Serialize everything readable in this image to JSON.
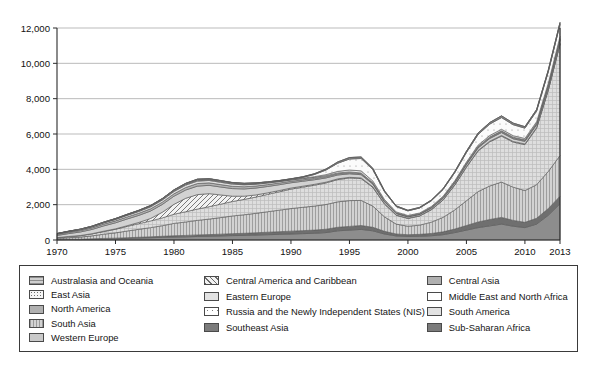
{
  "title": "",
  "legend": {
    "columns": [
      {
        "items": [
          {
            "label": "Australasia and Oceania",
            "swatch": "hlines-gray"
          },
          {
            "label": "East Asia",
            "swatch": "dots-light"
          },
          {
            "label": "North America",
            "swatch": "solid-midgray"
          },
          {
            "label": "South Asia",
            "swatch": "vlines-gray"
          },
          {
            "label": "Western Europe",
            "swatch": "solid-gray"
          }
        ]
      },
      {
        "items": [
          {
            "label": "Central America and Caribbean",
            "swatch": "diag-hatch"
          },
          {
            "label": "Eastern Europe",
            "swatch": "solid-lightgray"
          },
          {
            "label": "Russia and the Newly Independent States (NIS)",
            "swatch": "white-dot"
          },
          {
            "label": "Southeast Asia",
            "swatch": "solid-darkgray"
          }
        ]
      },
      {
        "items": [
          {
            "label": "Central Asia",
            "swatch": "solid-midgray"
          },
          {
            "label": "Middle East and North Africa",
            "swatch": "white-plain"
          },
          {
            "label": "South America",
            "swatch": "solid-lightgray"
          },
          {
            "label": "Sub-Saharan Africa",
            "swatch": "solid-darkgray"
          }
        ]
      }
    ]
  },
  "chart_data": {
    "type": "area",
    "stacked": true,
    "title": "",
    "xlabel": "",
    "ylabel": "",
    "xlim": [
      1970,
      2013
    ],
    "ylim": [
      0,
      12000
    ],
    "grid": true,
    "legend_position": "bottom",
    "ytick_labels": [
      "0",
      "2,000",
      "4,000",
      "6,000",
      "8,000",
      "10,000",
      "12,000"
    ],
    "yticks": [
      0,
      2000,
      4000,
      6000,
      8000,
      10000,
      12000
    ],
    "xtick_labels": [
      "1970",
      "1975",
      "1980",
      "1985",
      "1990",
      "1995",
      "2000",
      "2005",
      "2010",
      "2013"
    ],
    "xticks": [
      1970,
      1975,
      1980,
      1985,
      1990,
      1995,
      2000,
      2005,
      2010,
      2013
    ],
    "x": [
      1970,
      1971,
      1972,
      1973,
      1974,
      1975,
      1976,
      1977,
      1978,
      1979,
      1980,
      1981,
      1982,
      1983,
      1984,
      1985,
      1986,
      1987,
      1988,
      1989,
      1990,
      1991,
      1992,
      1993,
      1994,
      1995,
      1996,
      1997,
      1998,
      1999,
      2000,
      2001,
      2002,
      2003,
      2004,
      2005,
      2006,
      2007,
      2008,
      2009,
      2010,
      2011,
      2012,
      2013
    ],
    "series": [
      {
        "name": "Sub-Saharan Africa",
        "fill": "#8d8d8d",
        "values": [
          20,
          30,
          25,
          40,
          60,
          70,
          90,
          110,
          130,
          150,
          170,
          180,
          200,
          210,
          230,
          250,
          260,
          280,
          300,
          320,
          340,
          360,
          380,
          420,
          520,
          560,
          600,
          520,
          340,
          230,
          200,
          210,
          240,
          300,
          420,
          560,
          700,
          800,
          900,
          780,
          700,
          900,
          1400,
          2050
        ]
      },
      {
        "name": "Southeast Asia",
        "fill": "#6f6f6f",
        "values": [
          10,
          15,
          20,
          25,
          30,
          35,
          40,
          45,
          50,
          60,
          70,
          80,
          90,
          95,
          100,
          110,
          120,
          130,
          140,
          150,
          160,
          170,
          180,
          190,
          200,
          210,
          220,
          200,
          150,
          110,
          100,
          110,
          130,
          160,
          200,
          260,
          320,
          360,
          380,
          330,
          300,
          330,
          380,
          430
        ]
      },
      {
        "name": "South Asia",
        "fill": "#c8c8c8",
        "pattern": "vlines",
        "values": [
          60,
          90,
          120,
          170,
          240,
          300,
          380,
          450,
          520,
          600,
          700,
          760,
          820,
          880,
          940,
          1000,
          1050,
          1100,
          1160,
          1220,
          1280,
          1320,
          1360,
          1400,
          1440,
          1460,
          1420,
          1200,
          820,
          560,
          480,
          520,
          640,
          820,
          1080,
          1400,
          1720,
          1900,
          2000,
          1880,
          1800,
          1900,
          2100,
          2300
        ]
      },
      {
        "name": "Middle East and North Africa",
        "fill": "#dcdcdc",
        "pattern": "crosshatch",
        "values": [
          40,
          60,
          80,
          110,
          150,
          200,
          260,
          320,
          380,
          440,
          520,
          580,
          640,
          700,
          760,
          820,
          870,
          920,
          980,
          1040,
          1100,
          1140,
          1180,
          1220,
          1260,
          1280,
          1240,
          1060,
          720,
          500,
          440,
          520,
          700,
          980,
          1400,
          1900,
          2300,
          2500,
          2600,
          2550,
          2600,
          3200,
          4600,
          6300
        ]
      },
      {
        "name": "Central America and Caribbean",
        "fill": "#efefef",
        "pattern": "diag",
        "values": [
          5,
          8,
          10,
          14,
          20,
          28,
          40,
          70,
          140,
          320,
          560,
          760,
          820,
          740,
          520,
          300,
          180,
          120,
          90,
          70,
          60,
          55,
          50,
          45,
          40,
          38,
          36,
          32,
          24,
          18,
          16,
          16,
          18,
          20,
          24,
          28,
          32,
          36,
          40,
          38,
          36,
          40,
          46,
          52
        ]
      },
      {
        "name": "Western Europe",
        "fill": "#d2d2d2",
        "values": [
          120,
          160,
          200,
          240,
          300,
          340,
          380,
          400,
          420,
          440,
          460,
          470,
          480,
          470,
          450,
          430,
          410,
          390,
          360,
          330,
          300,
          280,
          260,
          240,
          220,
          200,
          180,
          150,
          110,
          80,
          70,
          70,
          75,
          85,
          100,
          120,
          140,
          150,
          160,
          150,
          145,
          150,
          165,
          180
        ]
      },
      {
        "name": "North America",
        "fill": "#b4b4b4",
        "values": [
          60,
          70,
          80,
          90,
          100,
          110,
          115,
          120,
          125,
          130,
          135,
          140,
          145,
          140,
          135,
          130,
          125,
          115,
          105,
          95,
          85,
          80,
          75,
          70,
          65,
          60,
          55,
          45,
          30,
          22,
          20,
          22,
          26,
          30,
          36,
          42,
          48,
          52,
          56,
          52,
          50,
          52,
          58,
          64
        ]
      },
      {
        "name": "South America",
        "fill": "#e2e2e2",
        "values": [
          30,
          40,
          50,
          60,
          70,
          80,
          90,
          100,
          110,
          120,
          130,
          135,
          140,
          135,
          130,
          120,
          110,
          100,
          90,
          80,
          70,
          65,
          60,
          55,
          50,
          46,
          42,
          36,
          26,
          20,
          18,
          18,
          20,
          22,
          26,
          30,
          34,
          38,
          42,
          40,
          38,
          40,
          44,
          48
        ]
      },
      {
        "name": "Eastern Europe",
        "fill": "#e8e8e8",
        "values": [
          10,
          12,
          14,
          16,
          20,
          24,
          28,
          32,
          36,
          40,
          44,
          48,
          52,
          50,
          48,
          44,
          40,
          36,
          32,
          28,
          26,
          30,
          40,
          60,
          90,
          110,
          120,
          100,
          70,
          50,
          44,
          44,
          48,
          54,
          62,
          70,
          78,
          84,
          90,
          84,
          80,
          84,
          92,
          100
        ]
      },
      {
        "name": "Russia and the Newly Independent States (NIS)",
        "fill": "#fafafa",
        "pattern": "dot-sparse",
        "values": [
          0,
          0,
          0,
          0,
          0,
          0,
          0,
          0,
          0,
          0,
          0,
          0,
          0,
          0,
          0,
          0,
          0,
          0,
          0,
          0,
          10,
          40,
          120,
          260,
          460,
          620,
          700,
          640,
          440,
          300,
          260,
          280,
          320,
          380,
          460,
          540,
          600,
          640,
          660,
          620,
          580,
          600,
          640,
          680
        ]
      },
      {
        "name": "East Asia",
        "fill": "#f2f2f2",
        "pattern": "dots",
        "values": [
          10,
          12,
          14,
          16,
          20,
          24,
          28,
          32,
          36,
          40,
          44,
          46,
          48,
          46,
          44,
          42,
          38,
          34,
          30,
          28,
          26,
          24,
          22,
          20,
          20,
          20,
          20,
          18,
          14,
          12,
          11,
          12,
          14,
          16,
          18,
          22,
          26,
          28,
          30,
          28,
          26,
          28,
          32,
          36
        ]
      },
      {
        "name": "Central Asia",
        "fill": "#bfbfbf",
        "values": [
          0,
          0,
          0,
          0,
          0,
          0,
          0,
          0,
          0,
          0,
          0,
          0,
          0,
          0,
          0,
          0,
          0,
          0,
          0,
          0,
          4,
          10,
          20,
          34,
          50,
          60,
          64,
          56,
          38,
          26,
          22,
          24,
          28,
          34,
          42,
          50,
          58,
          62,
          66,
          60,
          56,
          58,
          64,
          70
        ]
      },
      {
        "name": "Australasia and Oceania",
        "fill": "#cfcfcf",
        "pattern": "hlines",
        "values": [
          4,
          5,
          6,
          7,
          8,
          9,
          10,
          11,
          12,
          13,
          14,
          14,
          15,
          14,
          14,
          13,
          12,
          11,
          10,
          9,
          8,
          8,
          7,
          7,
          6,
          6,
          6,
          5,
          4,
          3,
          3,
          3,
          4,
          4,
          5,
          6,
          6,
          7,
          7,
          7,
          6,
          7,
          8,
          9
        ]
      }
    ]
  }
}
